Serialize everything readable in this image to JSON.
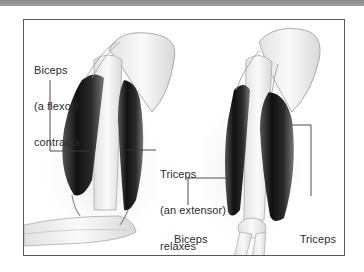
{
  "figure": {
    "left_arm": {
      "state": "flexed",
      "labels": [
        {
          "id": "biceps-contracts",
          "lines": [
            "Biceps",
            "(a flexor)",
            "contracts"
          ]
        },
        {
          "id": "triceps-relaxes",
          "lines": [
            "Triceps",
            "(an extensor)",
            "relaxes"
          ]
        }
      ]
    },
    "right_arm": {
      "state": "extended",
      "labels": [
        {
          "id": "biceps-relaxes",
          "lines": [
            "Biceps",
            "relaxes"
          ]
        },
        {
          "id": "triceps-contracts",
          "lines": [
            "Triceps",
            "contracts"
          ]
        }
      ]
    },
    "colors": {
      "muscle_dark": "#1e1e1e",
      "bone": "#f4f4f4",
      "bone_outline": "#9a9a9a",
      "leader_line": "#3a3a3a",
      "frame": "#5a5a5a",
      "text": "#2c2c2c"
    }
  }
}
